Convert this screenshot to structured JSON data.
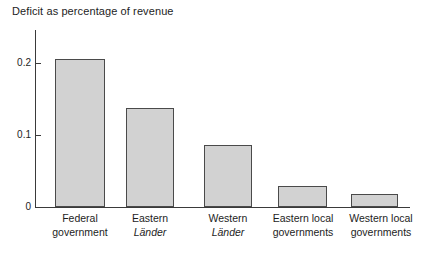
{
  "chart_data": {
    "type": "bar",
    "title": "Deficit as percentage of revenue",
    "xlabel": "",
    "ylabel": "",
    "ylim": [
      0,
      0.23
    ],
    "grid": false,
    "legend": null,
    "yticks": [
      "0",
      "0.1",
      "0.2"
    ],
    "ytick_values": [
      0,
      0.1,
      0.2
    ],
    "categories": [
      "Federal government",
      "Eastern Länder",
      "Western Länder",
      "Eastern local governments",
      "Western local governments"
    ],
    "values": [
      0.206,
      0.138,
      0.086,
      0.029,
      0.018
    ],
    "bar_color": "#d2d2d2",
    "bar_edge_color": "#4a4a4a",
    "axis_color": "#3a3a3a",
    "background": "#ffffff"
  },
  "axis": {
    "ticks": [
      {
        "label": "0.2",
        "value": 0.2
      },
      {
        "label": "0.1",
        "value": 0.1
      },
      {
        "label": "0",
        "value": 0
      }
    ]
  },
  "categories": [
    {
      "line1": "Federal",
      "line2": "government",
      "line2_italic": false
    },
    {
      "line1": "Eastern",
      "line2": "Länder",
      "line2_italic": true
    },
    {
      "line1": "Western",
      "line2": "Länder",
      "line2_italic": true
    },
    {
      "line1": "Eastern local",
      "line2": "governments",
      "line2_italic": false
    },
    {
      "line1": "Western local",
      "line2": "governments",
      "line2_italic": false
    }
  ]
}
